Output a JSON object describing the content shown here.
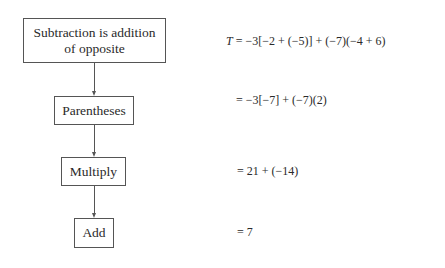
{
  "flowchart": {
    "steps": [
      {
        "label_line1": "Subtraction is addition",
        "label_line2": "of opposite"
      },
      {
        "label": "Parentheses"
      },
      {
        "label": "Multiply"
      },
      {
        "label": "Add"
      }
    ]
  },
  "equations": {
    "variable": "T",
    "lines": [
      "= −3[−2 + (−5)] + (−7)(−4 + 6)",
      "= −3[−7] + (−7)(2)",
      "= 21 + (−14)",
      "= 7"
    ]
  }
}
